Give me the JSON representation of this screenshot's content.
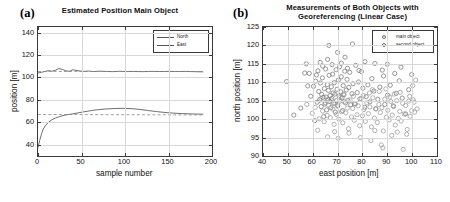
{
  "figure": {
    "panel_a_tag": "(a)",
    "panel_b_tag": "(b)"
  },
  "chart_data": [
    {
      "id": "panel_a",
      "type": "line",
      "title": "Estimated Position Main Object",
      "xlabel": "sample number",
      "ylabel": "position [m]",
      "xlim": [
        0,
        200
      ],
      "ylim": [
        30,
        145
      ],
      "xticks": [
        0,
        50,
        100,
        150,
        200
      ],
      "yticks": [
        40,
        60,
        80,
        100,
        120,
        140
      ],
      "grid": true,
      "legend_position": "top-right",
      "legend": [
        "North",
        "East"
      ],
      "series": [
        {
          "name": "North",
          "color": "#555555",
          "style": "solid",
          "x": [
            0,
            4,
            8,
            12,
            16,
            20,
            24,
            28,
            32,
            36,
            40,
            46,
            52,
            58,
            64,
            70,
            78,
            86,
            94,
            102,
            110,
            120,
            130,
            140,
            150,
            160,
            170,
            180,
            190
          ],
          "y": [
            104.0,
            104.6,
            105.4,
            106.0,
            105.6,
            106.4,
            107.9,
            107.2,
            105.9,
            105.5,
            106.9,
            106.0,
            105.4,
            105.7,
            105.3,
            105.6,
            105.4,
            105.2,
            105.5,
            105.3,
            105.4,
            105.2,
            105.4,
            105.3,
            105.4,
            105.3,
            105.4,
            105.2,
            105.0
          ]
        },
        {
          "name": "North reference",
          "color": "#8a8a8a",
          "style": "dashed",
          "x": [
            0,
            190
          ],
          "y": [
            105.3,
            105.3
          ]
        },
        {
          "name": "East",
          "color": "#555555",
          "style": "solid",
          "x": [
            0,
            2,
            4,
            6,
            9,
            12,
            16,
            20,
            25,
            30,
            35,
            40,
            46,
            52,
            60,
            68,
            76,
            84,
            92,
            100,
            108,
            116,
            126,
            136,
            146,
            156,
            166,
            176,
            186,
            190
          ],
          "y": [
            37.5,
            44.0,
            49.5,
            54.0,
            57.5,
            60.0,
            62.4,
            63.8,
            65.2,
            66.3,
            67.0,
            67.6,
            68.4,
            69.3,
            70.3,
            71.2,
            71.8,
            72.2,
            72.4,
            72.5,
            72.2,
            71.6,
            70.6,
            69.6,
            68.8,
            68.2,
            67.8,
            67.5,
            67.3,
            67.3
          ]
        },
        {
          "name": "East reference",
          "color": "#8a8a8a",
          "style": "dashed",
          "x": [
            0,
            190
          ],
          "y": [
            67.0,
            66.6
          ]
        }
      ]
    },
    {
      "id": "panel_b",
      "type": "scatter",
      "title": "Measurements of Both Objects with Georeferencing (Linear Case)",
      "xlabel": "east position [m]",
      "ylabel": "north position [m]",
      "xlim": [
        40,
        110
      ],
      "ylim": [
        90,
        125
      ],
      "xticks": [
        40,
        50,
        60,
        70,
        80,
        90,
        100,
        110
      ],
      "yticks": [
        90,
        95,
        100,
        105,
        110,
        115,
        120,
        125
      ],
      "grid": true,
      "legend_position": "top-right",
      "legend": [
        "main object",
        "second object"
      ],
      "marker": "open-circle",
      "series": [
        {
          "name": "main object",
          "color": "#777777",
          "points": [
            [
              49.5,
              110.2
            ],
            [
              52.4,
              101.1
            ],
            [
              56.8,
              112.5
            ],
            [
              58.6,
              112.4
            ],
            [
              59.2,
              106.2
            ],
            [
              60.3,
              108.9
            ],
            [
              61.2,
              110.3
            ],
            [
              61.8,
              104.6
            ],
            [
              62.1,
              113.1
            ],
            [
              62.4,
              107.5
            ],
            [
              62.8,
              105.2
            ],
            [
              63.1,
              109.8
            ],
            [
              63.4,
              103.4
            ],
            [
              63.6,
              106.7
            ],
            [
              63.9,
              111.2
            ],
            [
              64.2,
              105.9
            ],
            [
              64.4,
              100.7
            ],
            [
              64.7,
              108.3
            ],
            [
              64.9,
              104.1
            ],
            [
              65.2,
              113.6
            ],
            [
              65.4,
              106.0
            ],
            [
              65.6,
              102.5
            ],
            [
              65.9,
              109.4
            ],
            [
              66.1,
              105.3
            ],
            [
              66.3,
              107.8
            ],
            [
              66.6,
              111.9
            ],
            [
              66.8,
              104.8
            ],
            [
              67.0,
              106.4
            ],
            [
              67.3,
              103.1
            ],
            [
              67.5,
              108.8
            ],
            [
              67.7,
              105.6
            ],
            [
              68.0,
              112.2
            ],
            [
              68.2,
              107.1
            ],
            [
              68.4,
              104.3
            ],
            [
              68.7,
              109.9
            ],
            [
              68.9,
              106.8
            ],
            [
              69.1,
              101.9
            ],
            [
              69.4,
              113.4
            ],
            [
              69.6,
              105.0
            ],
            [
              69.8,
              108.1
            ],
            [
              70.1,
              103.7
            ],
            [
              70.3,
              110.6
            ],
            [
              70.6,
              106.3
            ],
            [
              70.8,
              114.2
            ],
            [
              71.0,
              104.9
            ],
            [
              71.3,
              107.4
            ],
            [
              71.5,
              111.5
            ],
            [
              71.8,
              105.8
            ],
            [
              72.0,
              102.3
            ],
            [
              72.3,
              109.1
            ],
            [
              72.6,
              106.6
            ],
            [
              72.9,
              113.0
            ],
            [
              73.2,
              104.4
            ],
            [
              73.5,
              107.9
            ],
            [
              73.8,
              110.8
            ],
            [
              74.1,
              105.1
            ],
            [
              74.5,
              108.6
            ],
            [
              74.9,
              112.7
            ],
            [
              75.3,
              103.9
            ],
            [
              75.8,
              106.9
            ],
            [
              76.2,
              109.6
            ],
            [
              76.8,
              104.2
            ],
            [
              77.3,
              114.6
            ],
            [
              77.9,
              107.2
            ],
            [
              78.4,
              110.1
            ],
            [
              79.0,
              105.5
            ],
            [
              79.6,
              112.9
            ],
            [
              80.2,
              108.4
            ],
            [
              80.9,
              103.2
            ],
            [
              81.5,
              106.1
            ],
            [
              82.2,
              109.3
            ],
            [
              83.0,
              104.7
            ],
            [
              83.8,
              111.0
            ],
            [
              84.6,
              107.6
            ],
            [
              85.4,
              102.8
            ],
            [
              86.2,
              105.4
            ],
            [
              87.0,
              108.7
            ],
            [
              88.0,
              113.3
            ],
            [
              89.0,
              104.0
            ],
            [
              90.1,
              106.5
            ],
            [
              91.2,
              109.2
            ],
            [
              92.4,
              103.6
            ],
            [
              93.6,
              107.0
            ],
            [
              94.8,
              110.4
            ],
            [
              96.0,
              105.7
            ],
            [
              97.4,
              101.4
            ],
            [
              98.6,
              108.0
            ],
            [
              99.8,
              112.1
            ],
            [
              55.2,
              103.0
            ],
            [
              57.4,
              115.0
            ],
            [
              60.8,
              99.6
            ],
            [
              63.0,
              115.4
            ],
            [
              66.0,
              116.2
            ],
            [
              70.0,
              118.1
            ],
            [
              73.0,
              116.8
            ],
            [
              76.0,
              120.4
            ],
            [
              81.0,
              115.6
            ],
            [
              66.5,
              120.0
            ],
            [
              71.5,
              115.2
            ],
            [
              85.0,
              115.1
            ],
            [
              90.0,
              114.9
            ],
            [
              95.5,
              114.1
            ],
            [
              58.0,
              109.0
            ],
            [
              61.5,
              112.0
            ],
            [
              64.0,
              114.4
            ],
            [
              67.8,
              114.8
            ],
            [
              74.0,
              113.8
            ],
            [
              78.6,
              113.2
            ],
            [
              88.5,
              111.7
            ],
            [
              93.0,
              112.4
            ]
          ]
        },
        {
          "name": "second object",
          "color": "#9a9a9a",
          "points": [
            [
              57.6,
              104.0
            ],
            [
              59.8,
              101.6
            ],
            [
              61.0,
              103.2
            ],
            [
              62.6,
              100.1
            ],
            [
              63.3,
              105.6
            ],
            [
              64.0,
              102.2
            ],
            [
              64.6,
              99.3
            ],
            [
              65.0,
              104.5
            ],
            [
              65.8,
              101.0
            ],
            [
              66.4,
              103.8
            ],
            [
              67.1,
              100.4
            ],
            [
              67.6,
              105.1
            ],
            [
              68.1,
              102.7
            ],
            [
              68.6,
              98.6
            ],
            [
              69.0,
              104.2
            ],
            [
              69.5,
              101.3
            ],
            [
              70.0,
              103.5
            ],
            [
              70.5,
              100.0
            ],
            [
              71.1,
              105.9
            ],
            [
              71.6,
              102.0
            ],
            [
              72.1,
              99.0
            ],
            [
              72.7,
              104.7
            ],
            [
              73.3,
              101.7
            ],
            [
              73.9,
              103.0
            ],
            [
              74.4,
              97.4
            ],
            [
              75.0,
              105.2
            ],
            [
              75.6,
              100.6
            ],
            [
              76.1,
              102.9
            ],
            [
              76.7,
              99.7
            ],
            [
              77.2,
              104.1
            ],
            [
              77.8,
              101.2
            ],
            [
              78.3,
              103.6
            ],
            [
              78.9,
              98.2
            ],
            [
              79.5,
              105.5
            ],
            [
              80.0,
              100.9
            ],
            [
              80.6,
              102.6
            ],
            [
              81.2,
              99.4
            ],
            [
              81.8,
              104.4
            ],
            [
              82.4,
              101.5
            ],
            [
              83.0,
              103.3
            ],
            [
              83.6,
              97.9
            ],
            [
              84.2,
              105.8
            ],
            [
              84.8,
              100.3
            ],
            [
              85.4,
              102.8
            ],
            [
              86.0,
              99.1
            ],
            [
              86.6,
              104.0
            ],
            [
              87.2,
              101.8
            ],
            [
              87.8,
              103.1
            ],
            [
              88.4,
              96.8
            ],
            [
              89.0,
              105.4
            ],
            [
              89.6,
              100.5
            ],
            [
              90.2,
              102.4
            ],
            [
              90.8,
              99.8
            ],
            [
              91.4,
              104.8
            ],
            [
              92.0,
              101.1
            ],
            [
              92.6,
              103.4
            ],
            [
              93.2,
              98.4
            ],
            [
              93.8,
              105.0
            ],
            [
              94.4,
              100.2
            ],
            [
              95.0,
              102.1
            ],
            [
              95.6,
              99.5
            ],
            [
              96.2,
              104.3
            ],
            [
              96.8,
              101.4
            ],
            [
              97.4,
              103.7
            ],
            [
              98.0,
              97.2
            ],
            [
              98.6,
              104.9
            ],
            [
              99.2,
              100.8
            ],
            [
              99.8,
              102.3
            ],
            [
              100.4,
              105.3
            ],
            [
              101.0,
              101.9
            ],
            [
              66.0,
              95.2
            ],
            [
              70.2,
              94.8
            ],
            [
              74.6,
              96.2
            ],
            [
              79.2,
              95.0
            ],
            [
              83.4,
              94.2
            ],
            [
              87.6,
              93.0
            ],
            [
              91.8,
              95.6
            ],
            [
              96.4,
              91.8
            ],
            [
              88.2,
              92.2
            ],
            [
              94.0,
              96.5
            ],
            [
              62.0,
              97.0
            ],
            [
              68.8,
              96.6
            ],
            [
              85.0,
              96.9
            ],
            [
              97.8,
              95.9
            ],
            [
              100.8,
              104.6
            ],
            [
              101.4,
              110.6
            ],
            [
              100.2,
              109.1
            ],
            [
              102.0,
              102.8
            ],
            [
              99.0,
              106.2
            ],
            [
              86.8,
              107.5
            ],
            [
              92.8,
              106.8
            ],
            [
              89.4,
              108.2
            ],
            [
              95.2,
              107.3
            ],
            [
              91.0,
              106.0
            ],
            [
              84.0,
              108.0
            ],
            [
              80.4,
              106.4
            ],
            [
              82.8,
              107.1
            ],
            [
              76.4,
              106.2
            ],
            [
              72.4,
              106.8
            ]
          ]
        }
      ]
    }
  ]
}
